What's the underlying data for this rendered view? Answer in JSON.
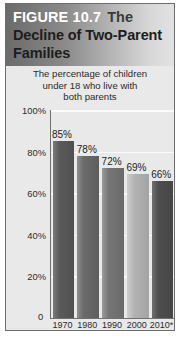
{
  "figure": {
    "label": "FIGURE 10.7",
    "title_the": "The",
    "title_line2": "Decline of Two-Parent",
    "title_line3": "Families",
    "subtitle_line1": "The percentage of children",
    "subtitle_line2": "under 18 who live with",
    "subtitle_line3": "both parents",
    "zero_label": "0"
  },
  "chart_data": {
    "type": "bar",
    "subtitle": "The percentage of children under 18 who live with both parents",
    "categories": [
      "1970",
      "1980",
      "1990",
      "2000",
      "2010*"
    ],
    "values": [
      85,
      78,
      72,
      69,
      66
    ],
    "data_labels": [
      "85%",
      "78%",
      "72%",
      "69%",
      "66%"
    ],
    "xlabel": "",
    "ylabel": "",
    "ylim": [
      0,
      100
    ],
    "ytick_labels": [
      "100%",
      "80%",
      "60%",
      "40%",
      "20%",
      "0"
    ],
    "ytick_values": [
      100,
      80,
      60,
      40,
      20,
      0
    ],
    "grid": true,
    "legend": false,
    "bar_colors": [
      "#4f4f4f",
      "#5d5d5d",
      "#6a6a6a",
      "#a3a3a3",
      "#464646"
    ]
  }
}
